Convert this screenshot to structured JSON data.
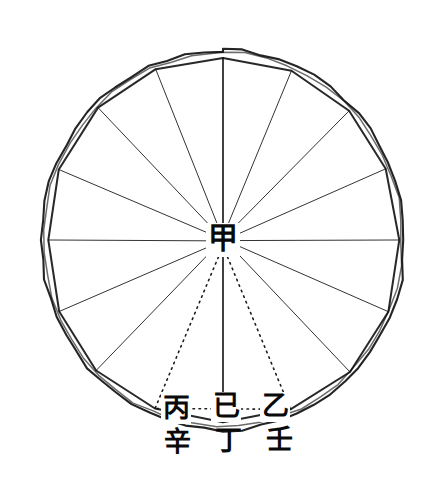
{
  "figure": {
    "background_color": "#ffffff",
    "ink_color": "#111111",
    "canvas": {
      "width": 441,
      "height": 491
    }
  },
  "geometry": {
    "circle": {
      "center_x": 223,
      "center_y": 240,
      "radius_x": 182,
      "radius_y": 190,
      "stroke_width": 2.1
    },
    "polygon": {
      "sides": 16,
      "radius_x": 177,
      "radius_y": 185,
      "stroke_width": 2.0,
      "note": "inscribed polygon drawn just inside the circle, vertices touching"
    },
    "spokes": {
      "count": 16,
      "stroke_width": 1.0,
      "note": "radii from centre to each polygon vertex"
    },
    "dotted_lines": {
      "stroke_width": 1.6,
      "dash": "1.5 4.5",
      "note": "two dotted radii to the lower-left and lower-right points plus the dotted chord joining them"
    },
    "vertical_axis": {
      "stroke_width": 1.6,
      "note": "solid vertical line from top vertex through centre down to the bottom vertex"
    }
  },
  "labels": {
    "center": {
      "char": "甲",
      "romanization": "jia",
      "x": 223,
      "y": 240
    },
    "upper_row": [
      {
        "char": "丙",
        "romanization": "bing",
        "x": 176,
        "y": 409
      },
      {
        "char": "已",
        "romanization": "yi",
        "x": 226,
        "y": 407
      },
      {
        "char": "乙",
        "romanization": "yi",
        "x": 275,
        "y": 407
      }
    ],
    "lower_row": [
      {
        "char": "辛",
        "romanization": "xin",
        "x": 177,
        "y": 443
      },
      {
        "char": "丁",
        "romanization": "ding",
        "x": 228,
        "y": 442
      },
      {
        "char": "壬",
        "romanization": "ren",
        "x": 279,
        "y": 441
      }
    ]
  }
}
